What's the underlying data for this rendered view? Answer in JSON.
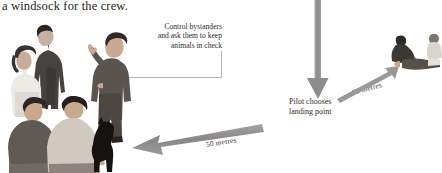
{
  "caption": {
    "text": "a windsock for the crew."
  },
  "callout": {
    "name": "control-bystanders-callout",
    "lines": [
      "Control bystanders",
      "and ask them to keep",
      "animals in check"
    ]
  },
  "pilot_label": {
    "name": "pilot-landing-point-label",
    "lines": [
      "Pilot chooses",
      "landing point"
    ]
  },
  "distances": {
    "left": "50 metres",
    "right": "50 metres"
  },
  "figures": {
    "bystander_group_label": "bystanders-standing-group",
    "speaker_label": "crew-member-directing-bystanders",
    "front_group_label": "bystanders-kneeling-with-dog",
    "casualty_group_label": "casualty-and-first-aider"
  },
  "colors": {
    "arrow": "#8e8c8a",
    "arrow_light": "#a7a5a3",
    "leader_line": "#b9b4ae",
    "text": "#2f2b27",
    "caption_text": "#2a2622",
    "background": "#ffffff"
  },
  "icons": {
    "down_arrow": "down-arrow-icon",
    "left_arrow": "left-arrow-icon",
    "up_right_arrow": "up-right-arrow-icon"
  }
}
